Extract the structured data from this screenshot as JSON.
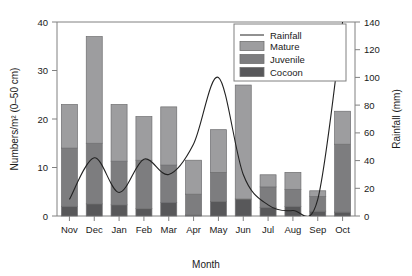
{
  "chart_data": {
    "type": "bar",
    "title": "",
    "subtitle": "",
    "xlabel": "Month",
    "ylabel": "Numbers/m² (0–50 cm)",
    "y2label": "Rainfall (mm)",
    "categories": [
      "Nov",
      "Dec",
      "Jan",
      "Feb",
      "Mar",
      "Apr",
      "May",
      "Jun",
      "Jul",
      "Aug",
      "Sep",
      "Oct"
    ],
    "ylim": [
      0,
      40
    ],
    "yticks": [
      0,
      10,
      20,
      30,
      40
    ],
    "y2lim": [
      0,
      140
    ],
    "y2ticks": [
      0,
      20,
      40,
      60,
      80,
      100,
      120,
      140
    ],
    "grid": false,
    "stacked": true,
    "legend_position": "top-right",
    "series": [
      {
        "name": "Cocoon",
        "axis": "left",
        "color": "#58585a",
        "values": [
          2.0,
          2.5,
          2.3,
          1.5,
          2.8,
          0.2,
          3.0,
          3.5,
          1.8,
          2.0,
          1.0,
          0.8
        ]
      },
      {
        "name": "Juvenile",
        "axis": "left",
        "color": "#7d7d7f",
        "values": [
          12.0,
          12.5,
          9.0,
          10.0,
          7.7,
          4.3,
          6.0,
          0.0,
          4.2,
          3.5,
          3.0,
          14.0
        ]
      },
      {
        "name": "Mature",
        "axis": "left",
        "color": "#9d9d9f",
        "values": [
          9.0,
          22.0,
          11.7,
          9.0,
          12.0,
          7.0,
          8.8,
          23.5,
          2.5,
          3.5,
          1.2,
          6.8
        ]
      },
      {
        "name": "Rainfall",
        "axis": "right",
        "type": "line",
        "color": "#222222",
        "values": [
          12,
          42,
          17,
          41,
          30,
          52,
          100,
          30,
          8,
          4,
          12,
          140
        ]
      }
    ],
    "totals": [
      23.0,
      37.0,
      23.0,
      20.5,
      22.5,
      11.5,
      17.8,
      27.0,
      8.5,
      9.0,
      5.2,
      21.6
    ],
    "legend": [
      {
        "label": "Rainfall",
        "swatch": "line",
        "color": "#222222"
      },
      {
        "label": "Mature",
        "swatch": "box",
        "color": "#9d9d9f"
      },
      {
        "label": "Juvenile",
        "swatch": "box",
        "color": "#7d7d7f"
      },
      {
        "label": "Cocoon",
        "swatch": "box",
        "color": "#58585a"
      }
    ]
  },
  "axes": {
    "left": {
      "title": "Numbers/m² (0–50 cm)",
      "ticks": [
        "0",
        "10",
        "20",
        "30",
        "40"
      ]
    },
    "right": {
      "title": "Rainfall (mm)",
      "ticks": [
        "0",
        "20",
        "40",
        "60",
        "80",
        "100",
        "120",
        "140"
      ]
    },
    "bottom": {
      "title": "Month",
      "ticks": [
        "Nov",
        "Dec",
        "Jan",
        "Feb",
        "Mar",
        "Apr",
        "May",
        "Jun",
        "Jul",
        "Aug",
        "Sep",
        "Oct"
      ]
    }
  }
}
